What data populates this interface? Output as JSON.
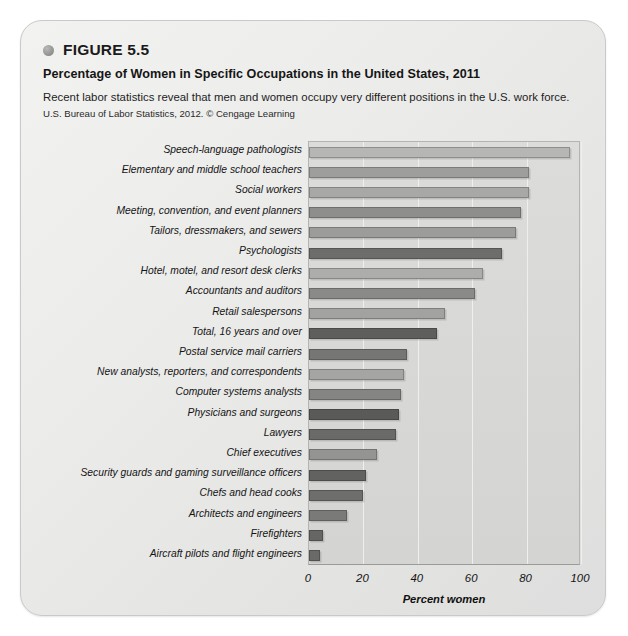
{
  "header": {
    "bullet_icon": "circle-bullet-icon",
    "figure_number": "FIGURE 5.5",
    "title": "Percentage of Women in Specific Occupations in the United States, 2011",
    "description": "Recent labor statistics reveal that men and women occupy very different positions in the U.S. work force.",
    "source": "U.S. Bureau of Labor Statistics, 2012. © Cengage Learning"
  },
  "chart_data": {
    "type": "bar",
    "orientation": "horizontal",
    "title": "Percentage of Women in Specific Occupations in the United States, 2011",
    "xlabel": "Percent women",
    "ylabel": "",
    "xlim": [
      0,
      100
    ],
    "xticks": [
      0,
      20,
      40,
      60,
      80,
      100
    ],
    "xtick_labels": [
      "0",
      "20",
      "40",
      "60",
      "80",
      "100"
    ],
    "grid": true,
    "grid_axis": "x",
    "legend": "none",
    "categories": [
      "Speech-language pathologists",
      "Elementary and middle school teachers",
      "Social workers",
      "Meeting, convention, and event planners",
      "Tailors, dressmakers, and sewers",
      "Psychologists",
      "Hotel, motel, and resort desk clerks",
      "Accountants and auditors",
      "Retail salespersons",
      "Total, 16 years and over",
      "Postal service mail carriers",
      "New analysts, reporters, and correspondents",
      "Computer systems analysts",
      "Physicians and surgeons",
      "Lawyers",
      "Chief executives",
      "Security guards and gaming surveillance officers",
      "Chefs and head cooks",
      "Architects and engineers",
      "Firefighters",
      "Aircraft pilots and flight engineers"
    ],
    "values": [
      96,
      81,
      81,
      78,
      76,
      71,
      64,
      61,
      50,
      47,
      36,
      35,
      34,
      33,
      32,
      25,
      21,
      20,
      14,
      5,
      4
    ],
    "bar_colors": [
      "#b6b6b4",
      "#9e9e9c",
      "#a8a8a6",
      "#8e8e8c",
      "#9c9c9a",
      "#6d6d6b",
      "#adadab",
      "#8a8a88",
      "#a2a2a0",
      "#5e5e5c",
      "#767674",
      "#a5a5a3",
      "#858583",
      "#5a5a58",
      "#6a6a68",
      "#949492",
      "#626260",
      "#6e6e6c",
      "#7a7a78",
      "#666664",
      "#6a6a68"
    ]
  }
}
